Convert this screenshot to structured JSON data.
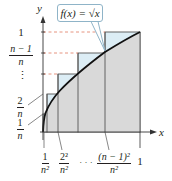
{
  "figure": {
    "type": "riemann-sum-diagram",
    "function_label": "f(x) = √x",
    "function_label_parts": {
      "lhs": "f(x) = ",
      "radical": "√",
      "radicand": "x"
    },
    "axes": {
      "x_label": "x",
      "y_label": "y"
    },
    "y_ticks": [
      {
        "label": "1",
        "kind": "integer"
      },
      {
        "num": "n − 1",
        "den": "n",
        "kind": "fraction"
      },
      {
        "label": "⋮",
        "kind": "ellipsis"
      },
      {
        "num": "2",
        "den": "n",
        "kind": "fraction"
      },
      {
        "num": "1",
        "den": "n",
        "kind": "fraction"
      }
    ],
    "x_ticks": [
      {
        "num": "1",
        "den": "n²",
        "kind": "fraction"
      },
      {
        "num": "2²",
        "den": "n²",
        "kind": "fraction"
      },
      {
        "label": "· · ·",
        "kind": "ellipsis"
      },
      {
        "num": "(n − 1)²",
        "den": "n²",
        "kind": "fraction"
      },
      {
        "label": "1",
        "kind": "integer"
      }
    ],
    "colors": {
      "under_curve": "#d9d9d9",
      "above_curve": "#dcedf5",
      "curve": "#111111",
      "dashed_guides": "#e07a5f",
      "callout_border": "#8fb4c8",
      "axis": "#333333"
    }
  }
}
